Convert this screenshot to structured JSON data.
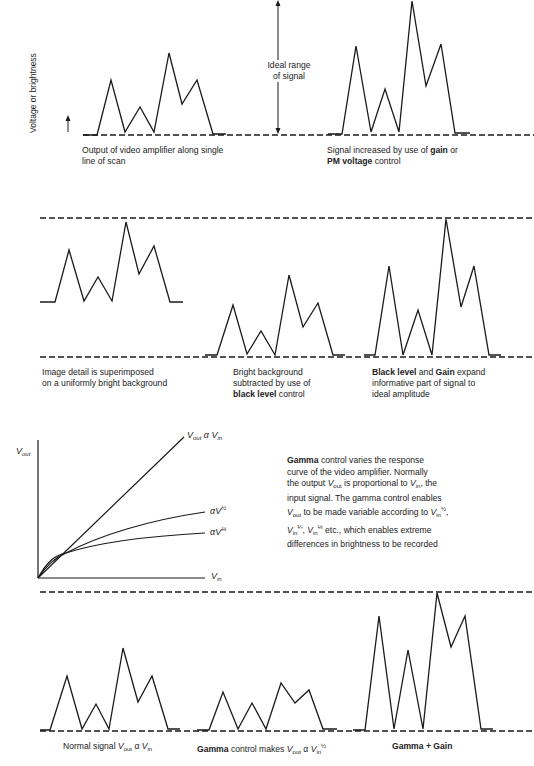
{
  "axis_label": "Voltage or brightness",
  "ideal_range": {
    "line1": "Ideal range",
    "line2": "of signal"
  },
  "panels": [
    {
      "id": "p1",
      "caption_lines": [
        "Output of video amplifier along single",
        "line of scan"
      ],
      "points": [
        [
          83,
          135
        ],
        [
          97,
          135
        ],
        [
          111,
          80
        ],
        [
          125,
          132
        ],
        [
          140,
          107
        ],
        [
          154,
          132
        ],
        [
          169,
          53
        ],
        [
          182,
          104
        ],
        [
          197,
          80
        ],
        [
          213,
          134
        ],
        [
          226,
          134
        ]
      ]
    },
    {
      "id": "p2",
      "caption_parts": {
        "a": "Signal increased by use of ",
        "b": "gain",
        "c": " or",
        "d": "PM voltage",
        "e": " control"
      },
      "points": [
        [
          328,
          134
        ],
        [
          342,
          134
        ],
        [
          356,
          46
        ],
        [
          371,
          132
        ],
        [
          385,
          89
        ],
        [
          399,
          132
        ],
        [
          412,
          1
        ],
        [
          426,
          86
        ],
        [
          441,
          44
        ],
        [
          455,
          133
        ],
        [
          470,
          133
        ]
      ]
    },
    {
      "id": "p3",
      "caption_lines": [
        "Image detail is superimposed",
        "on a uniformly bright background"
      ],
      "points": [
        [
          40,
          302
        ],
        [
          55,
          302
        ],
        [
          69,
          250
        ],
        [
          84,
          301
        ],
        [
          98,
          277
        ],
        [
          112,
          301
        ],
        [
          126,
          222
        ],
        [
          139,
          274
        ],
        [
          154,
          246
        ],
        [
          170,
          302
        ],
        [
          183,
          302
        ]
      ]
    },
    {
      "id": "p4",
      "caption_parts": {
        "a": "Bright background",
        "b": "subtracted by use of",
        "c": "black level",
        "d": " control"
      },
      "points": [
        [
          205,
          355
        ],
        [
          217,
          355
        ],
        [
          233,
          305
        ],
        [
          247,
          354
        ],
        [
          261,
          331
        ],
        [
          275,
          355
        ],
        [
          289,
          275
        ],
        [
          303,
          327
        ],
        [
          318,
          303
        ],
        [
          333,
          355
        ],
        [
          345,
          355
        ]
      ]
    },
    {
      "id": "p5",
      "caption_parts": {
        "a": "Black level",
        "b": " and ",
        "c": "Gain",
        "d": " expand",
        "e": "informative part of signal to",
        "f": "ideal amplitude"
      },
      "points": [
        [
          364,
          355
        ],
        [
          375,
          355
        ],
        [
          389,
          266
        ],
        [
          403,
          355
        ],
        [
          418,
          310
        ],
        [
          432,
          355
        ],
        [
          446,
          219
        ],
        [
          461,
          307
        ],
        [
          474,
          266
        ],
        [
          489,
          355
        ],
        [
          501,
          355
        ]
      ]
    },
    {
      "id": "p6",
      "caption_parts": {
        "a": "Normal signal ",
        "v": "V",
        "out": "out",
        "prop": " α ",
        "v2": "V",
        "in": "in"
      },
      "points": [
        [
          40,
          730
        ],
        [
          50,
          730
        ],
        [
          67,
          676
        ],
        [
          82,
          729
        ],
        [
          96,
          704
        ],
        [
          109,
          729
        ],
        [
          123,
          648
        ],
        [
          138,
          702
        ],
        [
          152,
          676
        ],
        [
          168,
          729
        ],
        [
          180,
          729
        ]
      ]
    },
    {
      "id": "p7",
      "caption_parts": {
        "a": "Gamma",
        "b": " control makes ",
        "v": "V",
        "out": "out",
        "prop": " α ",
        "v2": "V",
        "in": "in",
        "exp": "½"
      },
      "points": [
        [
          197,
          730
        ],
        [
          209,
          730
        ],
        [
          223,
          692
        ],
        [
          238,
          729
        ],
        [
          252,
          703
        ],
        [
          266,
          729
        ],
        [
          281,
          683
        ],
        [
          295,
          703
        ],
        [
          309,
          690
        ],
        [
          323,
          729
        ],
        [
          337,
          729
        ]
      ]
    },
    {
      "id": "p8",
      "caption": "Gamma + Gain",
      "points": [
        [
          353,
          730
        ],
        [
          365,
          730
        ],
        [
          379,
          616
        ],
        [
          394,
          729
        ],
        [
          408,
          650
        ],
        [
          423,
          729
        ],
        [
          437,
          593
        ],
        [
          451,
          647
        ],
        [
          465,
          616
        ],
        [
          481,
          729
        ],
        [
          493,
          729
        ]
      ]
    }
  ],
  "gamma_chart": {
    "y_axis_label": {
      "v": "V",
      "sub": "out"
    },
    "x_axis_label": {
      "v": "V",
      "sub": "in"
    },
    "curve_labels": [
      {
        "text": "V",
        "sub1": "out",
        "mid": " α V",
        "sub2": "in"
      },
      {
        "text": "αV",
        "exp": "½"
      },
      {
        "text": "αV",
        "exp": "¼"
      }
    ]
  },
  "gamma_text": {
    "bold": "Gamma",
    "l1": " control varies the response",
    "l2": "curve of the video amplifier. Normally",
    "l3a": "the output ",
    "l3v": "V",
    "l3s": "out",
    "l3b": " is proportional to ",
    "l3v2": "V",
    "l3s2": "in",
    "l3c": ", the",
    "l4": "input signal. The gamma control enables",
    "l5v": "V",
    "l5s": "out",
    "l5b": " to be made variable according to ",
    "l5v2": "V",
    "l5s2": "in",
    "l5e": "½",
    "l5c": ",",
    "l6v": "V",
    "l6s": "in",
    "l6e": "¼",
    "l6m": ", ",
    "l6v2": "V",
    "l6s2": "in",
    "l6e2": "⅓",
    "l6c": " etc., which enables extreme",
    "l7": "differences in brightness to be recorded"
  },
  "chart_data": {
    "type": "line",
    "xlabel": "Position along line of scan",
    "ylabel": "Voltage or brightness",
    "series": [
      {
        "name": "Output of video amplifier",
        "values": [
          0,
          0,
          0.41,
          0.02,
          0.21,
          0.02,
          0.62,
          0.23,
          0.41,
          0.01,
          0.01
        ]
      },
      {
        "name": "Signal increased by gain",
        "values": [
          0,
          0,
          0.66,
          0.02,
          0.34,
          0.02,
          1.0,
          0.36,
          0.67,
          0.01,
          0.01
        ]
      },
      {
        "name": "Superimposed on bright background",
        "values": [
          0.41,
          0.41,
          0.78,
          0.42,
          0.59,
          0.42,
          0.98,
          0.6,
          0.8,
          0.41,
          0.41
        ]
      },
      {
        "name": "Black level subtracted",
        "values": [
          0,
          0,
          0.36,
          0.01,
          0.18,
          0,
          0.58,
          0.2,
          0.37,
          0,
          0
        ]
      },
      {
        "name": "Black level + Gain",
        "values": [
          0,
          0,
          0.65,
          0,
          0.33,
          0,
          0.99,
          0.35,
          0.65,
          0,
          0
        ]
      },
      {
        "name": "Normal signal",
        "values": [
          0,
          0,
          0.39,
          0.01,
          0.19,
          0.01,
          0.59,
          0.2,
          0.39,
          0.01,
          0.01
        ]
      },
      {
        "name": "Gamma (V^1/2)",
        "values": [
          0,
          0,
          0.28,
          0.01,
          0.19,
          0.01,
          0.34,
          0.2,
          0.29,
          0.01,
          0.01
        ]
      },
      {
        "name": "Gamma + Gain",
        "values": [
          0,
          0,
          0.83,
          0.01,
          0.58,
          0.01,
          0.99,
          0.6,
          0.83,
          0.01,
          0.01
        ]
      }
    ],
    "gamma_curves": [
      {
        "name": "Vout α Vin",
        "exponent": 1
      },
      {
        "name": "αV^1/2",
        "exponent": 0.5
      },
      {
        "name": "αV^1/4",
        "exponent": 0.25
      }
    ]
  }
}
